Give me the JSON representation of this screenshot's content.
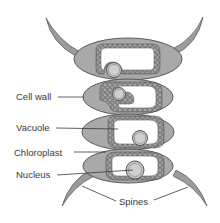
{
  "diagram": {
    "colors": {
      "background": "#ffffff",
      "cell_fill": "#a9a9a9",
      "cell_outline": "#5a5a5a",
      "vacuole_fill": "#ffffff",
      "chloroplast_fill": "#9a9a9a",
      "nucleus_fill": "#c4c4c4",
      "spine_fill": "#9c9c9c",
      "leader_line": "#3a3a3a",
      "text": "#3a3a3a"
    },
    "labels": [
      {
        "id": "cell-wall",
        "text": "Cell wall"
      },
      {
        "id": "vacuole",
        "text": "Vacuole"
      },
      {
        "id": "chloroplast",
        "text": "Chloroplast"
      },
      {
        "id": "nucleus",
        "text": "Nucleus"
      },
      {
        "id": "spines",
        "text": "Spines"
      }
    ],
    "cells_count": 4,
    "spines_count": 4
  }
}
